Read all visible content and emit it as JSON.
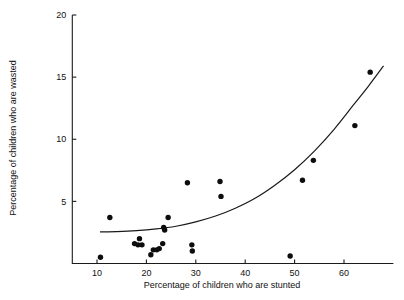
{
  "chart_data": {
    "type": "scatter",
    "title": "",
    "xlabel": "Percentage of children who are stunted",
    "ylabel": "Percentage of children who are wasted",
    "xlim": [
      5,
      70
    ],
    "ylim": [
      0,
      20
    ],
    "xticks": [
      10,
      20,
      30,
      40,
      50,
      60
    ],
    "xtick_labels": [
      "10",
      "20",
      "30",
      "40",
      "50",
      "60"
    ],
    "yticks": [
      5,
      10,
      15,
      20
    ],
    "ytick_labels": [
      "5",
      "10",
      "15",
      "20"
    ],
    "grid": false,
    "legend": false,
    "marker_color": "#0d0d0d",
    "curve_color": "#1a1a1a",
    "points": [
      {
        "x": 10.7,
        "y": 0.5
      },
      {
        "x": 12.6,
        "y": 3.7
      },
      {
        "x": 17.6,
        "y": 1.6
      },
      {
        "x": 18.3,
        "y": 1.5
      },
      {
        "x": 18.6,
        "y": 2.0
      },
      {
        "x": 19.1,
        "y": 1.5
      },
      {
        "x": 20.9,
        "y": 0.7
      },
      {
        "x": 21.4,
        "y": 1.1
      },
      {
        "x": 22.1,
        "y": 1.1
      },
      {
        "x": 22.6,
        "y": 1.2
      },
      {
        "x": 23.3,
        "y": 1.6
      },
      {
        "x": 23.5,
        "y": 2.9
      },
      {
        "x": 23.7,
        "y": 2.7
      },
      {
        "x": 24.4,
        "y": 3.7
      },
      {
        "x": 28.3,
        "y": 6.5
      },
      {
        "x": 29.2,
        "y": 1.5
      },
      {
        "x": 29.3,
        "y": 1.0
      },
      {
        "x": 34.9,
        "y": 6.6
      },
      {
        "x": 35.1,
        "y": 5.4
      },
      {
        "x": 49.1,
        "y": 0.6
      },
      {
        "x": 51.6,
        "y": 6.7
      },
      {
        "x": 53.8,
        "y": 8.3
      },
      {
        "x": 62.2,
        "y": 11.1
      },
      {
        "x": 65.3,
        "y": 15.4
      }
    ],
    "fit_curve": {
      "label": "fitted trend",
      "x_start": 10.6,
      "x_end": 68.0,
      "points": [
        {
          "x": 10.6,
          "y": 2.55
        },
        {
          "x": 14.0,
          "y": 2.57
        },
        {
          "x": 18.0,
          "y": 2.64
        },
        {
          "x": 22.0,
          "y": 2.78
        },
        {
          "x": 26.0,
          "y": 3.0
        },
        {
          "x": 30.0,
          "y": 3.35
        },
        {
          "x": 34.0,
          "y": 3.82
        },
        {
          "x": 38.0,
          "y": 4.45
        },
        {
          "x": 42.0,
          "y": 5.25
        },
        {
          "x": 46.0,
          "y": 6.3
        },
        {
          "x": 50.0,
          "y": 7.55
        },
        {
          "x": 54.0,
          "y": 9.05
        },
        {
          "x": 58.0,
          "y": 10.8
        },
        {
          "x": 62.0,
          "y": 12.8
        },
        {
          "x": 65.0,
          "y": 14.3
        },
        {
          "x": 68.0,
          "y": 15.9
        }
      ]
    }
  }
}
